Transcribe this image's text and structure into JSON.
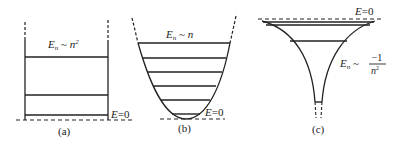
{
  "panels": [
    {
      "id": "a",
      "caption": "(a)",
      "well": "infinite square well",
      "formula": {
        "lhs": "E",
        "sub": "n",
        "rel": "~",
        "rhs": "n",
        "sup": "2"
      },
      "zero_label": "E=0",
      "levels_y": [
        57,
        95,
        115
      ]
    },
    {
      "id": "b",
      "caption": "(b)",
      "well": "harmonic oscillator",
      "formula": {
        "lhs": "E",
        "sub": "n",
        "rel": "~",
        "rhs": "n"
      },
      "zero_label": "E=0",
      "levels_y": [
        43,
        58,
        72,
        86,
        100,
        114
      ]
    },
    {
      "id": "c",
      "caption": "(c)",
      "well": "Coulomb potential",
      "formula": {
        "lhs": "E",
        "sub": "n",
        "rel": "~",
        "num": "−1",
        "den": "n",
        "den_sup": "2"
      },
      "zero_label": "E=0"
    }
  ],
  "colors": {
    "ink": "#222222",
    "background": "#ffffff"
  }
}
